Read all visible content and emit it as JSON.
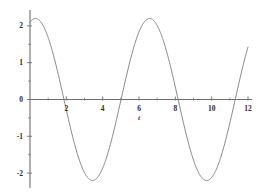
{
  "chart_data": {
    "type": "line",
    "title": "",
    "subtitle": "",
    "xlabel": "t",
    "ylabel": "",
    "xlim": [
      0,
      12
    ],
    "ylim": [
      -2.35,
      2.35
    ],
    "grid": false,
    "legend": null,
    "axis_style": "origin-crossed",
    "xticks": [
      0,
      2,
      4,
      6,
      8,
      10,
      12
    ],
    "xtick_labels": [
      "",
      "2",
      "4",
      "6",
      "8",
      "10",
      "12"
    ],
    "xminor_ticks": [
      1,
      3,
      5,
      7,
      9,
      11
    ],
    "yticks": [
      -2,
      -1,
      0,
      1,
      2
    ],
    "ytick_labels": [
      "-2",
      "-1",
      "0",
      "1",
      "2"
    ],
    "yminor_ticks": [
      -1.5,
      -0.5,
      0.5,
      1.5
    ],
    "series": [
      {
        "name": "y(t)",
        "color": "#707070",
        "amplitude": 2.2,
        "angular_frequency": 1.0,
        "phase": -0.3,
        "formula": "2.2*cos(t - 0.3)",
        "x": [
          0,
          0.25,
          0.5,
          0.75,
          1,
          1.25,
          1.5,
          1.75,
          2,
          2.25,
          2.5,
          2.75,
          3,
          3.25,
          3.5,
          3.75,
          4,
          4.25,
          4.5,
          4.75,
          5,
          5.25,
          5.5,
          5.75,
          6,
          6.25,
          6.5,
          6.75,
          7,
          7.25,
          7.5,
          7.75,
          8,
          8.25,
          8.5,
          8.75,
          9,
          9.25,
          9.5,
          9.75,
          10,
          10.25,
          10.5,
          10.75,
          11,
          11.25,
          11.5,
          11.75,
          12
        ],
        "y": [
          2.1,
          2.19,
          2.18,
          2.06,
          1.85,
          1.55,
          1.18,
          0.76,
          0.31,
          -0.15,
          -0.6,
          -1.03,
          -1.41,
          -1.74,
          -2,
          -2.16,
          -2.2,
          -2.2,
          -2.08,
          -1.88,
          -1.6,
          -1.25,
          -0.85,
          -0.41,
          0.05,
          0.5,
          0.94,
          1.34,
          1.68,
          1.95,
          2.14,
          2.2,
          2.2,
          2.11,
          1.92,
          1.65,
          1.3,
          0.9,
          0.47,
          0.01,
          -0.44,
          -0.88,
          -1.28,
          -1.63,
          -1.91,
          -2.11,
          -2.2,
          -2.2,
          -2.12
        ]
      }
    ],
    "key_points": {
      "start_value": 2.1,
      "end_value": 2.12,
      "maxima": [
        {
          "x": 0.3,
          "y": 2.2
        },
        {
          "x": 6.58,
          "y": 2.2
        }
      ],
      "minima": [
        {
          "x": 2.84,
          "y": -2.2
        },
        {
          "x": 9.13,
          "y": -2.2
        }
      ],
      "zero_crossings": [
        1.3,
        4.2,
        7.4,
        10.5
      ],
      "period": 6.28,
      "peak_amplitude": 2.2
    }
  },
  "colors": {
    "background": "#ffffff",
    "curve": "#707070",
    "axis": "#6e6e6e",
    "text": "#2b2b2b"
  }
}
